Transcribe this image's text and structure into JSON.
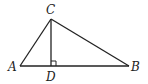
{
  "diagram": {
    "type": "geometry-triangle",
    "points": {
      "A": {
        "label": "A",
        "x": 20,
        "y": 66
      },
      "B": {
        "label": "B",
        "x": 129,
        "y": 66
      },
      "C": {
        "label": "C",
        "x": 51,
        "y": 19
      },
      "D": {
        "label": "D",
        "x": 51,
        "y": 66
      }
    },
    "segments": [
      "AB",
      "AC",
      "BC",
      "CD"
    ],
    "right_angle_at": "D",
    "stroke_color": "#222222"
  }
}
